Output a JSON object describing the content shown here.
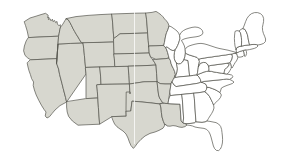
{
  "figure": {
    "name": "united-states-map",
    "background_color": "#ffffff",
    "width": 287,
    "height": 164
  },
  "style": {
    "shaded_fill": "#d7d7cf",
    "plain_fill": "#ffffff",
    "border_color": "#55544e",
    "border_width": 0.7,
    "seam_artifact_color": "#ffffff"
  },
  "legend": {
    "shaded_label": "Western states (shaded)",
    "plain_label": "Eastern states (unshaded)",
    "divide_label": "Mississippi River divide"
  },
  "regions": {
    "shaded": [
      "Washington",
      "Oregon",
      "California",
      "Nevada",
      "Idaho",
      "Montana",
      "Wyoming",
      "Utah",
      "Arizona",
      "Colorado",
      "New Mexico",
      "North Dakota",
      "South Dakota",
      "Nebraska",
      "Kansas",
      "Oklahoma",
      "Texas",
      "Minnesota",
      "Iowa",
      "Missouri",
      "Arkansas",
      "Louisiana"
    ],
    "plain": [
      "Wisconsin",
      "Illinois",
      "Michigan",
      "Indiana",
      "Ohio",
      "Kentucky",
      "Tennessee",
      "Mississippi",
      "Alabama",
      "Georgia",
      "Florida",
      "South Carolina",
      "North Carolina",
      "Virginia",
      "West Virginia",
      "Maryland",
      "Delaware",
      "Pennsylvania",
      "New Jersey",
      "New York",
      "Connecticut",
      "Rhode Island",
      "Massachusetts",
      "Vermont",
      "New Hampshire",
      "Maine"
    ]
  },
  "states": [
    {
      "id": "WA",
      "name": "Washington",
      "shaded": true,
      "d": "M24.5,21.5 L30,18.0 L36,16.2 L41,14.6 L45.5,13.3 L48.2,15.2 L47.6,17.8 L49.0,17.0 L48.4,19.6 L50.0,18.6 L51.0,20.8 L52.4,19.2 L53.0,21.6 L54.6,20.4 L55.6,22.6 L57.0,21.4 L57.4,24.0 L59.0,25.8 L60.2,24.6 L60.6,27.0 L59.8,29.8 L59.2,33.4 L58.6,36.2 L44.0,36.8 L28.6,37.6 L27.2,31.0 L25.6,25.8 Z"
    },
    {
      "id": "OR",
      "name": "Oregon",
      "shaded": true,
      "d": "M28.6,37.6 L44.0,36.8 L58.6,36.2 L58.0,44.0 L57.4,52.0 L57.0,58.6 L40.0,59.4 L30.6,59.8 L27.8,58.0 L25.0,55.4 L23.6,50.8 L24.4,46.0 L26.0,41.4 Z"
    },
    {
      "id": "CA",
      "name": "California",
      "shaded": true,
      "d": "M30.6,59.8 L40.0,59.4 L57.0,58.6 L56.6,63.4 L58.6,69.0 L59.6,74.4 L60.8,79.0 L62.0,83.6 L63.2,88.4 L64.4,93.0 L65.6,97.6 L66.6,102.0 L60.0,105.6 L55.0,110.0 L52.0,113.6 L49.6,116.6 L47.0,118.0 L45.2,116.0 L46.0,112.0 L44.0,109.4 L41.4,105.2 L38.8,100.4 L36.2,95.0 L34.4,90.0 L33.2,85.4 L33.6,82.0 L31.6,78.6 L30.4,74.6 L29.0,70.8 L28.0,67.0 L27.2,63.2 Z"
    },
    {
      "id": "NV",
      "name": "Nevada",
      "shaded": true,
      "d": "M57.0,58.6 L57.4,52.0 L58.0,44.0 L70.8,43.4 L83.2,42.8 L83.8,49.0 L84.4,55.4 L85.0,61.8 L85.6,68.2 L86.0,74.0 L66.6,102.0 L65.6,97.6 L64.4,93.0 L63.2,88.4 L62.0,83.6 L60.8,79.0 L59.6,74.4 L58.6,69.0 L56.6,63.4 Z"
    },
    {
      "id": "ID",
      "name": "Idaho",
      "shaded": true,
      "d": "M58.6,36.2 L59.2,33.4 L59.8,29.8 L60.6,27.0 L62.4,24.8 L63.6,22.8 L65.0,20.4 L66.2,18.6 L68.4,20.0 L70.0,22.6 L71.6,25.6 L73.0,28.6 L74.6,31.4 L76.2,34.2 L78.0,37.0 L79.6,39.8 L81.4,42.6 L83.2,42.8 L70.8,43.4 L58.0,44.0 L57.4,52.0 L57.0,58.6 L56.6,63.4 Z"
    },
    {
      "id": "MT",
      "name": "Montana",
      "shaded": true,
      "d": "M66.2,18.6 L76.0,16.6 L88.0,15.4 L100.0,14.6 L112.0,14.0 L112.6,22.4 L113.2,30.6 L113.8,38.6 L113.6,42.0 L100.0,42.4 L88.0,42.6 L83.2,42.8 L81.4,42.6 L79.6,39.8 L78.0,37.0 L76.2,34.2 L74.6,31.4 L73.0,28.6 L71.6,25.6 L70.0,22.6 L68.4,20.0 Z"
    },
    {
      "id": "WY",
      "name": "Wyoming",
      "shaded": true,
      "d": "M83.2,42.8 L88.0,42.6 L100.0,42.4 L113.6,42.0 L114.0,50.6 L114.4,59.2 L114.8,66.6 L100.0,67.0 L86.2,67.4 L85.6,68.2 L85.0,61.8 L84.4,55.4 L83.8,49.0 Z"
    },
    {
      "id": "UT",
      "name": "Utah",
      "shaded": true,
      "d": "M85.6,68.2 L86.2,67.4 L100.0,67.0 L100.6,76.4 L101.0,84.4 L97.0,84.8 L97.4,92.0 L97.8,98.0 L86.0,98.6 L86.0,74.0 Z"
    },
    {
      "id": "AZ",
      "name": "Arizona",
      "shaded": true,
      "d": "M86.0,98.6 L97.8,98.0 L98.4,107.4 L99.0,116.0 L99.6,124.2 L86.0,124.8 L78.0,125.2 L72.4,121.0 L68.6,116.4 L67.2,112.0 L66.6,107.0 L66.6,102.0 Z"
    },
    {
      "id": "CO",
      "name": "Colorado",
      "shaded": true,
      "d": "M100.0,67.0 L114.8,66.6 L128.4,66.2 L129.0,76.0 L129.4,84.0 L114.0,84.2 L101.0,84.4 L100.6,76.4 Z"
    },
    {
      "id": "NM",
      "name": "New Mexico",
      "shaded": true,
      "d": "M97.0,84.8 L101.0,84.4 L114.0,84.2 L129.4,84.0 L130.0,94.0 L130.4,103.0 L130.8,111.0 L126.0,111.2 L126.2,116.2 L112.0,116.6 L99.6,124.2 L99.0,116.0 L98.4,107.4 L97.8,98.0 L97.4,92.0 Z"
    },
    {
      "id": "ND",
      "name": "North Dakota",
      "shaded": true,
      "d": "M112.0,14.0 L124.0,13.6 L136.0,13.2 L146.0,13.0 L146.6,20.0 L147.2,27.0 L147.6,33.0 L134.0,33.4 L120.0,33.8 L113.8,38.6 L113.2,30.6 L112.6,22.4 Z"
    },
    {
      "id": "SD",
      "name": "South Dakota",
      "shaded": true,
      "d": "M113.8,38.6 L120.0,33.8 L134.0,33.4 L147.6,33.0 L148.2,40.2 L148.8,47.4 L149.2,53.0 L135.0,53.4 L121.0,53.8 L114.0,54.0 L113.6,42.0 Z"
    },
    {
      "id": "NE",
      "name": "Nebraska",
      "shaded": true,
      "d": "M114.0,54.0 L121.0,53.8 L135.0,53.4 L149.2,53.0 L150.6,57.0 L152.8,59.8 L154.4,62.2 L156.0,65.0 L150.0,65.4 L140.0,65.8 L128.4,66.2 L114.8,66.6 L114.4,59.2 Z"
    },
    {
      "id": "KS",
      "name": "Kansas",
      "shaded": true,
      "d": "M128.4,66.2 L140.0,65.8 L150.0,65.4 L156.0,65.0 L156.6,73.6 L157.2,81.6 L144.0,81.8 L129.4,84.0 L129.0,76.0 Z"
    },
    {
      "id": "OK",
      "name": "Oklahoma",
      "shaded": true,
      "d": "M126.0,111.2 L126.2,92.0 L130.2,92.0 L130.0,94.0 L129.4,84.0 L144.0,81.8 L157.2,81.6 L157.8,88.6 L158.6,95.0 L159.6,98.0 L161.2,100.4 L162.6,102.6 L160.0,104.0 L155.0,103.4 L150.0,102.8 L144.0,102.2 L138.0,101.6 L132.0,101.2 L130.8,111.0 Z"
    },
    {
      "id": "TX",
      "name": "Texas",
      "shaded": true,
      "d": "M112.0,116.6 L126.2,116.2 L126.0,111.2 L130.8,111.0 L132.0,101.2 L138.0,101.6 L144.0,102.2 L150.0,102.8 L155.0,103.4 L160.0,104.0 L161.0,108.0 L161.4,112.6 L162.0,117.0 L163.4,121.4 L165.0,125.0 L163.0,128.2 L159.0,130.4 L155.0,132.0 L150.0,133.4 L145.0,136.0 L141.0,139.4 L137.6,143.0 L135.0,146.6 L133.4,148.4 L131.0,145.6 L129.4,142.0 L128.0,138.0 L126.0,134.0 L123.0,131.0 L120.0,129.0 L117.0,126.8 L114.6,124.0 L113.0,120.6 Z"
    },
    {
      "id": "MN",
      "name": "Minnesota",
      "shaded": true,
      "d": "M146.0,13.0 L152.0,12.4 L156.0,11.4 L158.6,13.0 L161.0,14.8 L163.0,16.8 L164.6,19.0 L166.4,20.8 L168.0,23.0 L169.0,26.0 L168.0,29.4 L166.6,32.6 L165.6,36.0 L165.0,39.4 L164.4,42.6 L163.8,45.4 L156.0,45.8 L149.2,46.0 L148.8,47.4 L148.2,40.2 L147.6,33.0 L147.2,27.0 L146.6,20.0 Z"
    },
    {
      "id": "IA",
      "name": "Iowa",
      "shaded": true,
      "d": "M149.2,46.0 L156.0,45.8 L163.8,45.4 L165.6,47.4 L166.8,50.0 L167.6,52.6 L168.4,55.4 L169.0,58.0 L166.0,58.6 L161.0,59.0 L156.0,59.4 L150.6,57.0 L149.2,53.0 L148.8,47.4 Z"
    },
    {
      "id": "MO",
      "name": "Missouri",
      "shaded": true,
      "d": "M156.0,59.4 L161.0,59.0 L166.0,58.6 L169.0,58.0 L170.4,60.6 L171.0,63.4 L172.0,66.0 L173.4,68.6 L174.6,71.4 L175.4,74.4 L174.4,77.0 L173.2,79.6 L172.0,82.0 L171.0,84.0 L165.0,84.0 L160.0,83.6 L157.2,81.6 L156.6,73.6 L156.0,65.0 L154.4,62.2 L152.8,59.8 Z"
    },
    {
      "id": "AR",
      "name": "Arkansas",
      "shaded": true,
      "d": "M157.2,81.6 L160.0,83.6 L165.0,84.0 L171.0,84.0 L170.4,88.0 L169.8,92.0 L169.2,96.0 L168.6,100.0 L168.0,103.6 L165.0,103.4 L162.6,102.6 L161.2,100.4 L159.6,98.0 L158.6,95.0 L157.8,88.6 Z"
    },
    {
      "id": "LA",
      "name": "Louisiana",
      "shaded": true,
      "d": "M165.0,103.4 L168.0,103.6 L171.0,103.8 L176.0,104.0 L180.0,104.2 L180.4,110.0 L180.8,116.0 L181.2,121.0 L183.0,123.0 L185.4,123.6 L187.0,125.0 L185.0,126.6 L182.0,127.4 L179.0,127.0 L176.0,126.0 L173.0,125.6 L170.0,126.2 L167.0,126.0 L165.4,124.0 L165.0,125.0 L163.4,121.4 L162.0,117.0 L161.4,112.6 L161.0,108.0 L160.0,104.0 Z"
    },
    {
      "id": "WI",
      "name": "Wisconsin",
      "shaded": false,
      "d": "M163.8,45.4 L164.4,42.6 L165.0,39.4 L165.6,36.0 L166.6,32.6 L168.0,29.4 L169.0,26.0 L171.0,26.6 L173.0,28.0 L175.0,29.4 L177.0,31.0 L178.6,33.0 L179.6,35.4 L180.0,38.0 L179.4,40.6 L178.6,43.2 L177.6,45.6 L176.4,48.0 L175.0,50.0 L173.0,50.6 L171.0,50.0 L169.0,48.6 L167.0,47.0 L165.6,47.4 Z"
    },
    {
      "id": "MI",
      "name": "Michigan",
      "shaded": false,
      "d": "M180.0,38.0 L179.6,35.4 L181.0,32.6 L183.4,30.6 L186.0,29.2 L189.0,28.2 L192.0,27.4 L195.0,27.0 L198.0,27.4 L200.6,28.6 L202.4,30.6 L203.0,33.0 L201.6,35.0 L199.0,36.2 L196.0,36.8 L193.0,37.2 L190.0,37.6 L187.0,38.2 L184.0,39.0 L181.4,40.4 L183.0,43.0 L184.4,46.0 L185.2,49.4 L185.4,53.0 L185.0,56.4 L184.0,59.4 L182.6,62.0 L180.6,63.6 L178.4,64.0 L176.4,63.0 L175.0,61.0 L174.2,58.4 L174.0,55.4 L174.4,52.4 L175.0,50.0 L176.4,48.0 L177.6,45.6 L178.6,43.2 L179.4,40.6 Z"
    },
    {
      "id": "IL",
      "name": "Illinois",
      "shaded": false,
      "d": "M169.0,58.0 L168.4,55.4 L167.6,52.6 L166.8,50.0 L165.6,47.4 L167.0,47.0 L169.0,48.6 L171.0,50.0 L173.0,50.6 L175.0,50.0 L174.4,52.4 L174.0,55.4 L174.2,58.4 L175.0,61.0 L176.4,63.0 L177.0,66.0 L177.4,69.0 L177.0,72.0 L176.0,75.0 L175.0,77.6 L174.4,77.0 L175.4,74.4 L174.6,71.4 L173.4,68.6 L172.0,66.0 L171.0,63.4 L170.4,60.6 Z"
    },
    {
      "id": "IN",
      "name": "Indiana",
      "shaded": false,
      "d": "M177.0,66.0 L176.4,63.0 L178.4,64.0 L180.6,63.6 L182.6,62.0 L184.0,59.4 L186.0,60.0 L188.0,60.6 L188.4,64.0 L188.8,68.0 L189.2,72.0 L189.6,76.0 L185.0,76.4 L180.0,76.8 L175.0,77.6 L176.0,75.0 L177.0,72.0 L177.4,69.0 Z"
    },
    {
      "id": "OH",
      "name": "Ohio",
      "shaded": false,
      "d": "M184.0,59.4 L185.0,56.4 L185.4,53.0 L187.0,54.0 L189.4,55.0 L192.0,55.8 L194.6,56.6 L197.0,57.4 L198.6,59.0 L199.4,61.4 L199.0,64.0 L198.4,66.6 L198.0,69.4 L197.6,72.2 L197.0,75.0 L193.4,75.4 L189.6,76.0 L189.2,72.0 L188.8,68.0 L188.4,64.0 L188.0,60.6 L186.0,60.0 Z"
    },
    {
      "id": "KY",
      "name": "Kentucky",
      "shaded": false,
      "d": "M175.0,77.6 L180.0,76.8 L185.0,76.4 L189.6,76.0 L193.4,75.4 L197.0,75.0 L199.0,77.0 L200.4,79.4 L201.0,82.0 L199.0,83.0 L196.0,83.6 L192.0,84.2 L188.0,84.8 L184.0,85.4 L180.0,86.0 L176.0,86.6 L174.0,85.0 L172.6,83.0 L172.0,82.0 L173.2,79.6 Z"
    },
    {
      "id": "TN",
      "name": "Tennessee",
      "shaded": false,
      "d": "M172.0,82.0 L172.6,83.0 L174.0,85.0 L176.0,86.6 L180.0,86.0 L184.0,85.4 L188.0,84.8 L192.0,84.2 L196.0,83.6 L199.0,83.0 L201.0,82.0 L203.6,83.0 L206.0,84.4 L207.0,87.0 L206.4,89.6 L205.0,91.6 L202.0,92.2 L198.0,92.8 L194.0,93.2 L190.0,93.6 L186.0,94.0 L182.0,94.4 L178.0,94.8 L174.0,95.2 L170.4,95.6 L169.8,92.0 L170.4,88.0 L171.0,84.0 Z"
    },
    {
      "id": "MS",
      "name": "Mississippi",
      "shaded": false,
      "d": "M170.4,95.6 L174.0,95.2 L178.0,94.8 L182.0,94.4 L182.4,100.0 L182.8,106.0 L183.2,112.0 L183.6,118.0 L183.0,123.0 L181.2,121.0 L180.8,116.0 L180.4,110.0 L180.0,104.2 L176.0,104.0 L171.0,103.8 L168.0,103.6 L168.6,100.0 Z"
    },
    {
      "id": "AL",
      "name": "Alabama",
      "shaded": false,
      "d": "M182.0,94.4 L186.0,94.0 L190.0,93.6 L194.0,93.2 L194.4,99.0 L194.8,105.0 L195.2,111.0 L195.6,117.0 L196.0,122.0 L194.0,123.0 L191.0,123.4 L188.0,123.6 L185.4,123.6 L183.0,123.0 L183.6,118.0 L183.2,112.0 L182.8,106.0 L182.4,100.0 Z"
    },
    {
      "id": "GA",
      "name": "Georgia",
      "shaded": false,
      "d": "M194.0,93.2 L198.0,92.8 L202.0,92.2 L205.0,91.6 L207.6,94.0 L209.6,96.6 L211.0,99.4 L212.4,102.2 L213.6,105.0 L214.0,108.0 L213.0,111.0 L211.6,113.6 L210.0,116.0 L208.4,118.6 L207.0,121.0 L205.0,122.0 L202.0,122.4 L199.0,122.2 L196.0,122.0 L195.6,117.0 L195.2,111.0 L194.8,105.0 L194.4,99.0 Z"
    },
    {
      "id": "FL",
      "name": "Florida",
      "shaded": false,
      "d": "M196.0,122.0 L199.0,122.2 L202.0,122.4 L205.0,122.0 L207.0,121.0 L210.0,121.4 L213.0,122.0 L216.0,122.6 L218.6,124.0 L220.6,126.4 L221.6,129.4 L222.0,132.6 L222.4,136.0 L222.6,139.4 L222.4,143.0 L221.6,146.4 L220.4,149.0 L218.6,150.6 L216.4,150.4 L214.6,148.6 L213.4,146.0 L212.6,143.0 L211.8,140.0 L211.0,137.0 L210.0,134.0 L208.6,131.4 L206.6,129.4 L204.0,128.4 L201.0,128.0 L198.0,127.6 L195.0,127.0 L192.6,126.0 L190.0,125.4 L187.0,125.0 L185.4,123.6 L188.0,123.6 L191.0,123.4 L194.0,123.0 Z"
    },
    {
      "id": "SC",
      "name": "South Carolina",
      "shaded": false,
      "d": "M205.0,91.6 L206.4,89.6 L207.0,87.0 L209.6,87.6 L212.4,88.6 L215.0,89.6 L217.6,91.0 L220.0,92.6 L221.4,95.0 L220.4,97.6 L218.6,99.8 L216.6,101.8 L214.6,103.6 L213.6,105.0 L212.4,102.2 L211.0,99.4 L209.6,96.6 L207.6,94.0 Z"
    },
    {
      "id": "NC",
      "name": "North Carolina",
      "shaded": false,
      "d": "M207.0,87.0 L206.0,84.4 L203.6,83.0 L201.0,82.0 L204.0,81.4 L208.0,81.0 L212.0,80.6 L216.0,80.2 L220.0,79.8 L223.6,79.4 L226.6,79.0 L229.6,79.4 L232.0,80.6 L234.0,82.0 L232.6,83.4 L230.0,84.4 L227.0,85.4 L224.0,86.6 L221.4,88.0 L220.0,92.6 L217.6,91.0 L215.0,89.6 L212.4,88.6 L209.6,87.6 Z"
    },
    {
      "id": "VA",
      "name": "Virginia",
      "shaded": false,
      "d": "M201.0,82.0 L200.4,79.4 L199.0,77.0 L197.0,75.0 L199.0,74.0 L201.6,73.0 L204.0,72.0 L206.6,71.4 L209.0,71.0 L211.6,71.4 L214.0,72.0 L216.6,72.4 L219.0,72.8 L221.6,73.2 L224.0,73.6 L226.6,74.0 L229.0,74.4 L231.6,75.0 L233.0,76.4 L232.0,78.0 L230.0,79.0 L229.6,79.4 L226.6,79.0 L223.6,79.4 L220.0,79.8 L216.0,80.2 L212.0,80.6 L208.0,81.0 L204.0,81.4 Z"
    },
    {
      "id": "WV",
      "name": "West Virginia",
      "shaded": false,
      "d": "M197.0,75.0 L197.6,72.2 L198.0,69.4 L198.4,66.6 L199.0,64.0 L201.0,63.0 L203.4,62.4 L205.6,62.6 L207.4,64.0 L208.6,66.0 L209.0,68.4 L209.0,71.0 L206.6,71.4 L204.0,72.0 L201.6,73.0 L199.0,74.0 Z"
    },
    {
      "id": "MD",
      "name": "Maryland",
      "shaded": false,
      "d": "M209.0,71.0 L209.0,68.4 L208.6,66.0 L211.0,65.4 L214.0,65.0 L217.0,64.6 L220.0,64.2 L223.0,63.8 L226.0,63.4 L228.0,63.0 L229.0,65.0 L228.0,66.8 L226.4,68.0 L225.0,69.4 L224.4,71.4 L224.0,73.6 L221.6,73.2 L219.0,72.8 L216.6,72.4 L214.0,72.0 L211.6,71.4 Z"
    },
    {
      "id": "DE",
      "name": "Delaware",
      "shaded": false,
      "d": "M228.0,63.0 L230.0,62.8 L231.0,64.6 L231.4,66.6 L231.0,68.6 L230.0,70.4 L229.0,72.0 L228.0,73.4 L226.6,74.0 L224.0,73.6 L224.4,71.4 L225.0,69.4 L226.4,68.0 L228.0,66.8 L229.0,65.0 Z"
    },
    {
      "id": "PA",
      "name": "Pennsylvania",
      "shaded": false,
      "d": "M198.4,66.6 L199.0,64.0 L199.4,61.4 L198.6,59.0 L201.0,58.6 L204.6,58.0 L208.0,57.4 L211.6,57.0 L215.0,56.4 L218.6,56.0 L222.0,55.4 L225.6,55.0 L229.0,54.4 L232.0,54.0 L232.4,56.6 L232.0,59.0 L231.0,61.0 L230.0,62.8 L228.0,63.0 L226.0,63.4 L223.0,63.8 L220.0,64.2 L217.0,64.6 L214.0,65.0 L211.0,65.4 L208.6,66.0 L207.4,64.0 L205.6,62.6 L203.4,62.4 L201.0,63.0 Z"
    },
    {
      "id": "NJ",
      "name": "New Jersey",
      "shaded": false,
      "d": "M232.0,54.0 L234.0,53.4 L236.0,53.6 L237.4,55.0 L238.0,57.0 L237.4,59.0 L236.4,61.0 L235.0,62.8 L234.0,64.6 L233.0,66.4 L232.0,68.0 L231.4,66.6 L231.0,64.6 L230.0,62.8 L231.0,61.0 L232.0,59.0 L232.4,56.6 Z"
    },
    {
      "id": "NY",
      "name": "New York",
      "shaded": false,
      "d": "M198.6,59.0 L197.0,57.4 L194.6,56.6 L192.0,55.8 L189.4,55.0 L187.0,54.0 L185.4,53.0 L185.2,49.4 L186.6,47.4 L189.0,46.0 L192.0,45.0 L195.0,44.2 L198.0,43.6 L201.0,43.4 L204.0,43.8 L207.0,44.6 L210.0,45.6 L213.0,46.6 L216.0,47.6 L219.0,48.4 L222.0,49.0 L225.0,49.6 L228.0,50.2 L231.0,51.0 L234.0,51.8 L236.6,52.6 L234.0,53.4 L232.0,54.0 L229.0,54.4 L225.6,55.0 L222.0,55.4 L218.6,56.0 L215.0,56.4 L211.6,57.0 L208.0,57.4 L204.6,58.0 L201.0,58.6 Z"
    },
    {
      "id": "CT",
      "name": "Connecticut",
      "shaded": false,
      "d": "M236.6,52.6 L240.0,51.4 L243.4,50.4 L244.0,52.6 L244.4,55.0 L243.0,56.4 L241.0,57.0 L239.0,57.2 L237.4,56.6 L237.0,54.6 Z"
    },
    {
      "id": "RI",
      "name": "Rhode Island",
      "shaded": false,
      "d": "M243.4,50.4 L245.6,49.8 L246.4,51.4 L246.6,53.4 L246.0,55.4 L245.0,56.6 L244.4,55.0 L244.0,52.6 Z"
    },
    {
      "id": "MA",
      "name": "Massachusetts",
      "shaded": false,
      "d": "M236.6,52.6 L236.0,49.6 L237.0,47.6 L239.0,46.6 L242.0,46.0 L245.0,45.4 L248.0,45.0 L251.0,44.6 L254.0,44.4 L256.6,44.6 L258.0,46.0 L256.6,47.4 L254.4,48.4 L252.0,49.0 L249.4,49.6 L247.0,50.0 L245.6,49.8 L243.4,50.4 L240.0,51.4 Z"
    },
    {
      "id": "VT",
      "name": "Vermont",
      "shaded": false,
      "d": "M236.0,49.6 L235.0,46.0 L234.6,42.4 L234.4,38.6 L234.6,35.0 L235.0,31.4 L237.0,30.6 L239.0,31.0 L240.4,32.6 L241.0,35.0 L241.4,37.6 L241.6,40.4 L241.6,43.0 L241.4,45.6 L242.0,46.0 L239.0,46.6 L237.0,47.6 Z"
    },
    {
      "id": "NH",
      "name": "New Hampshire",
      "shaded": false,
      "d": "M241.4,45.6 L241.6,43.0 L241.6,40.4 L241.4,37.6 L241.0,35.0 L240.4,32.6 L239.0,31.0 L241.0,29.4 L243.0,28.4 L245.0,29.6 L246.4,32.0 L247.4,34.6 L248.0,37.4 L248.4,40.0 L249.0,42.6 L249.6,45.0 L248.0,45.0 L245.0,45.4 L242.0,46.0 Z"
    },
    {
      "id": "ME",
      "name": "Maine",
      "shaded": false,
      "d": "M243.0,28.4 L244.4,25.0 L245.6,21.6 L247.0,18.4 L249.0,15.6 L251.6,13.6 L254.6,12.6 L257.6,12.6 L260.4,13.6 L262.6,15.6 L263.6,18.4 L263.6,21.4 L263.0,24.4 L262.4,27.4 L262.6,30.4 L263.4,33.4 L264.6,36.2 L265.6,39.0 L265.4,41.6 L263.6,43.4 L261.0,44.4 L258.0,45.0 L256.6,44.6 L254.0,44.4 L251.0,44.6 L249.6,45.0 L249.0,42.6 L248.4,40.0 L248.0,37.4 L247.4,34.6 L246.4,32.0 L245.0,29.6 Z"
    }
  ]
}
